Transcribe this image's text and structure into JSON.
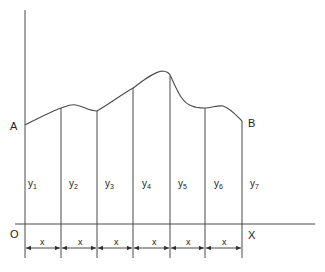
{
  "diagram": {
    "title": "",
    "points": {
      "A": "A",
      "B": "B",
      "origin": "O",
      "x_axis": "X"
    },
    "ordinates": [
      {
        "base": "y",
        "sub": "1"
      },
      {
        "base": "y",
        "sub": "2"
      },
      {
        "base": "y",
        "sub": "3"
      },
      {
        "base": "y",
        "sub": "4"
      },
      {
        "base": "y",
        "sub": "5"
      },
      {
        "base": "y",
        "sub": "6"
      },
      {
        "base": "y",
        "sub": "7"
      }
    ],
    "intervals": [
      "x",
      "x",
      "x",
      "x",
      "x",
      "x"
    ],
    "strip_count": 6,
    "ordinate_count": 7,
    "colors": {
      "line": "#4a4a4a",
      "text": "#222222",
      "background": "#ffffff"
    }
  }
}
